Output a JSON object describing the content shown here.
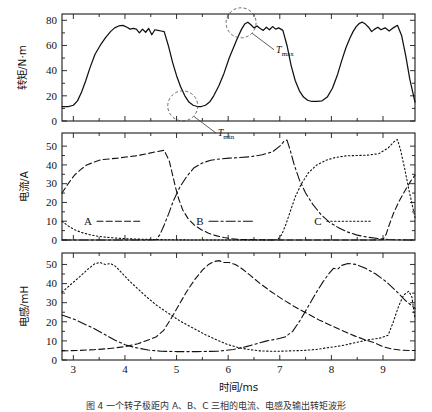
{
  "figure": {
    "caption": "图 4  一个转子极距内 A、B、C 三相的电流、电感及输出转矩波形"
  },
  "chart_data": [
    {
      "type": "line",
      "title": "",
      "panel": "torque",
      "xlabel": "",
      "ylabel": "转矩/N·m",
      "xlim": [
        2.78,
        9.62
      ],
      "ylim": [
        0,
        85
      ],
      "yticks": [
        0,
        20,
        40,
        60,
        80
      ],
      "xticks": [
        3,
        4,
        5,
        6,
        7,
        8,
        9
      ],
      "grid": false,
      "legend": "none",
      "annotations": [
        {
          "label": "T",
          "sub": "max",
          "x": 6.25,
          "y": 78
        },
        {
          "label": "T",
          "sub": "min",
          "x": 5.12,
          "y": 12
        }
      ],
      "series": [
        {
          "name": "Total torque",
          "style": "solid",
          "x": [
            2.78,
            2.9,
            3.0,
            3.08,
            3.16,
            3.24,
            3.32,
            3.42,
            3.52,
            3.62,
            3.72,
            3.8,
            3.88,
            3.96,
            4.04,
            4.1,
            4.16,
            4.22,
            4.28,
            4.34,
            4.4,
            4.46,
            4.52,
            4.58,
            4.64,
            4.7,
            4.76,
            4.84,
            4.92,
            5.0,
            5.08,
            5.16,
            5.24,
            5.32,
            5.4,
            5.48,
            5.56,
            5.64,
            5.72,
            5.82,
            5.92,
            6.02,
            6.1,
            6.18,
            6.26,
            6.32,
            6.38,
            6.44,
            6.5,
            6.56,
            6.62,
            6.68,
            6.74,
            6.8,
            6.86,
            6.92,
            6.98,
            7.06,
            7.14,
            7.22,
            7.3,
            7.38,
            7.46,
            7.54,
            7.62,
            7.72,
            7.82,
            7.92,
            8.02,
            8.12,
            8.2,
            8.28,
            8.36,
            8.42,
            8.48,
            8.54,
            8.6,
            8.66,
            8.72,
            8.78,
            8.84,
            8.9,
            8.96,
            9.04,
            9.12,
            9.2,
            9.28,
            9.36,
            9.44,
            9.52,
            9.62
          ],
          "y": [
            11.5,
            11.5,
            12.5,
            16.0,
            23.0,
            32.0,
            42.0,
            53.0,
            60.0,
            66.0,
            71.0,
            74.0,
            75.5,
            76.0,
            74.5,
            73.0,
            73.5,
            73.0,
            70.0,
            73.0,
            70.5,
            73.5,
            68.5,
            72.5,
            72.0,
            71.5,
            71.0,
            60.0,
            47.0,
            36.0,
            27.0,
            20.0,
            15.0,
            12.5,
            11.5,
            11.5,
            12.5,
            15.0,
            20.0,
            28.0,
            38.0,
            50.0,
            58.0,
            66.0,
            73.0,
            77.0,
            78.5,
            76.5,
            74.0,
            75.5,
            73.5,
            72.0,
            74.5,
            72.5,
            75.0,
            73.0,
            74.0,
            72.0,
            60.0,
            44.0,
            32.0,
            24.0,
            19.0,
            16.5,
            15.5,
            15.5,
            16.0,
            19.0,
            26.0,
            37.0,
            48.0,
            58.0,
            66.0,
            71.0,
            75.0,
            77.5,
            78.5,
            77.0,
            74.5,
            71.0,
            73.0,
            74.5,
            72.5,
            74.0,
            71.5,
            74.0,
            76.0,
            68.0,
            52.0,
            33.0,
            15.0
          ]
        }
      ]
    },
    {
      "type": "line",
      "panel": "current",
      "xlabel": "",
      "ylabel": "电流/A",
      "xlim": [
        2.78,
        9.62
      ],
      "ylim": [
        0,
        57
      ],
      "yticks": [
        0,
        10,
        20,
        30,
        40,
        50
      ],
      "xticks": [
        3,
        4,
        5,
        6,
        7,
        8,
        9
      ],
      "grid": false,
      "legend": "inside",
      "legend_entries": [
        {
          "label": "A",
          "style": "dashed"
        },
        {
          "label": "B",
          "style": "dashdot"
        },
        {
          "label": "C",
          "style": "dotted"
        }
      ],
      "series": [
        {
          "name": "A",
          "style": "dashed",
          "x": [
            2.78,
            2.9,
            3.02,
            3.14,
            3.26,
            3.4,
            3.54,
            3.7,
            3.86,
            4.02,
            4.2,
            4.4,
            4.6,
            4.76,
            4.86,
            4.92,
            4.98,
            5.04,
            5.12,
            5.22,
            5.34,
            5.48,
            5.62,
            5.78,
            5.92,
            6.05,
            6.2,
            6.6,
            7.0,
            7.5,
            8.0,
            8.5,
            8.8,
            9.0,
            9.06,
            9.12,
            9.2,
            9.3,
            9.42,
            9.54,
            9.62
          ],
          "y": [
            25.0,
            30.0,
            34.5,
            37.5,
            40.0,
            41.5,
            42.8,
            43.2,
            43.6,
            44.2,
            44.8,
            45.8,
            47.0,
            47.8,
            42.0,
            35.0,
            28.0,
            22.0,
            16.0,
            11.5,
            8.0,
            5.5,
            3.6,
            2.2,
            1.3,
            0.7,
            0.3,
            0.1,
            0.0,
            0.0,
            0.0,
            0.0,
            0.0,
            0.2,
            3.0,
            8.0,
            14.0,
            20.0,
            26.0,
            31.5,
            34.5
          ]
        },
        {
          "name": "B",
          "style": "dashdot",
          "x": [
            2.78,
            3.2,
            3.6,
            4.0,
            4.4,
            4.6,
            4.68,
            4.76,
            4.84,
            4.94,
            5.06,
            5.2,
            5.34,
            5.5,
            5.66,
            5.84,
            6.02,
            6.22,
            6.44,
            6.66,
            6.86,
            7.0,
            7.08,
            7.14,
            7.2,
            7.28,
            7.38,
            7.5,
            7.64,
            7.8,
            7.96,
            8.14,
            8.32,
            8.5,
            8.7,
            8.9,
            9.1,
            9.3,
            9.5,
            9.62
          ],
          "y": [
            0.0,
            0.0,
            0.0,
            0.0,
            0.0,
            0.1,
            3.0,
            8.0,
            13.5,
            21.0,
            28.0,
            34.0,
            38.5,
            41.0,
            42.5,
            43.2,
            43.6,
            43.9,
            44.4,
            45.4,
            47.0,
            50.0,
            52.5,
            53.2,
            48.0,
            40.0,
            32.0,
            25.0,
            19.0,
            13.5,
            9.5,
            6.5,
            4.2,
            2.6,
            1.5,
            0.8,
            0.3,
            0.1,
            0.0,
            0.0
          ]
        },
        {
          "name": "C",
          "style": "dotted",
          "x": [
            2.78,
            2.9,
            3.02,
            3.16,
            3.32,
            3.5,
            3.7,
            3.95,
            4.2,
            4.5,
            4.9,
            5.4,
            5.9,
            6.4,
            6.8,
            6.96,
            7.04,
            7.12,
            7.2,
            7.3,
            7.42,
            7.56,
            7.72,
            7.9,
            8.08,
            8.28,
            8.48,
            8.7,
            8.92,
            9.1,
            9.22,
            9.28,
            9.34,
            9.42,
            9.5,
            9.58,
            9.62
          ],
          "y": [
            10.0,
            7.5,
            5.5,
            4.0,
            2.8,
            1.9,
            1.3,
            0.8,
            0.5,
            0.3,
            0.1,
            0.0,
            0.0,
            0.0,
            0.0,
            0.2,
            3.0,
            8.5,
            15.0,
            23.0,
            30.0,
            36.0,
            40.0,
            42.5,
            44.0,
            44.8,
            45.0,
            45.2,
            46.0,
            49.0,
            52.5,
            53.5,
            48.0,
            38.0,
            27.0,
            17.0,
            12.0
          ]
        }
      ]
    },
    {
      "type": "line",
      "panel": "inductance",
      "xlabel": "时间/ms",
      "ylabel": "电感/mH",
      "xlim": [
        2.78,
        9.62
      ],
      "ylim": [
        0,
        56
      ],
      "yticks": [
        0,
        10,
        20,
        30,
        40,
        50
      ],
      "xticks": [
        3,
        4,
        5,
        6,
        7,
        8,
        9
      ],
      "grid": false,
      "legend": "none",
      "series": [
        {
          "name": "A",
          "style": "dashed",
          "x": [
            2.78,
            3.1,
            3.4,
            3.7,
            4.0,
            4.25,
            4.45,
            4.6,
            4.75,
            4.9,
            5.05,
            5.2,
            5.35,
            5.5,
            5.62,
            5.72,
            5.82,
            5.92,
            6.02,
            6.14,
            6.28,
            6.44,
            6.62,
            6.82,
            7.04,
            7.28,
            7.52,
            7.76,
            8.0,
            8.24,
            8.46,
            8.66,
            8.84,
            9.0,
            9.16,
            9.34,
            9.5,
            9.62
          ],
          "y": [
            4.8,
            5.0,
            5.4,
            6.0,
            7.0,
            8.5,
            10.5,
            12.0,
            15.5,
            22.0,
            29.0,
            36.0,
            42.0,
            47.0,
            50.0,
            51.5,
            52.0,
            51.0,
            51.0,
            50.0,
            47.5,
            44.0,
            40.0,
            36.0,
            32.0,
            28.0,
            24.5,
            21.0,
            18.0,
            15.0,
            12.5,
            10.5,
            9.0,
            7.0,
            5.8,
            5.2,
            5.0,
            5.0
          ]
        },
        {
          "name": "B",
          "style": "dashdot",
          "x": [
            2.78,
            3.0,
            3.2,
            3.4,
            3.6,
            3.8,
            4.0,
            4.2,
            4.45,
            4.7,
            5.0,
            5.4,
            5.8,
            6.1,
            6.35,
            6.55,
            6.75,
            6.95,
            7.1,
            7.25,
            7.4,
            7.55,
            7.7,
            7.84,
            7.96,
            8.04,
            8.12,
            8.2,
            8.32,
            8.48,
            8.66,
            8.86,
            9.06,
            9.26,
            9.44,
            9.62
          ],
          "y": [
            23.5,
            21.5,
            19.0,
            16.5,
            13.5,
            10.5,
            8.0,
            6.5,
            5.2,
            4.6,
            4.4,
            4.4,
            4.6,
            5.5,
            7.0,
            8.5,
            10.0,
            11.0,
            12.0,
            15.0,
            21.0,
            28.0,
            35.0,
            41.0,
            45.5,
            48.0,
            47.5,
            49.5,
            50.5,
            50.0,
            48.0,
            45.0,
            41.0,
            36.0,
            31.0,
            27.0
          ]
        },
        {
          "name": "C",
          "style": "dotted",
          "x": [
            2.78,
            2.95,
            3.12,
            3.28,
            3.42,
            3.52,
            3.62,
            3.72,
            3.82,
            3.94,
            4.08,
            4.24,
            4.42,
            4.62,
            4.84,
            5.06,
            5.3,
            5.54,
            5.78,
            6.0,
            6.2,
            6.4,
            6.6,
            6.8,
            7.0,
            7.2,
            7.45,
            7.7,
            7.95,
            8.2,
            8.45,
            8.7,
            8.95,
            9.1,
            9.2,
            9.3,
            9.4,
            9.5,
            9.56,
            9.62
          ],
          "y": [
            35.5,
            39.5,
            43.5,
            47.5,
            50.5,
            51.0,
            50.0,
            50.5,
            49.0,
            45.5,
            41.5,
            37.5,
            33.0,
            28.5,
            24.5,
            20.5,
            17.0,
            13.5,
            10.5,
            8.0,
            6.5,
            5.5,
            4.8,
            4.6,
            4.6,
            4.8,
            5.0,
            5.5,
            6.5,
            7.5,
            9.0,
            10.5,
            11.5,
            13.0,
            20.0,
            28.0,
            34.0,
            36.0,
            33.0,
            21.5
          ]
        }
      ]
    }
  ]
}
